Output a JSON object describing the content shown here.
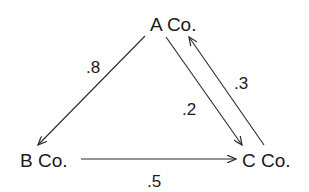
{
  "diagram": {
    "type": "directed-graph",
    "nodes": [
      {
        "id": "A",
        "label": "A Co."
      },
      {
        "id": "B",
        "label": "B Co."
      },
      {
        "id": "C",
        "label": "C Co."
      }
    ],
    "edges": [
      {
        "from": "A",
        "to": "B",
        "label": ".8"
      },
      {
        "from": "A",
        "to": "C",
        "label": ".2"
      },
      {
        "from": "C",
        "to": "A",
        "label": ".3"
      },
      {
        "from": "B",
        "to": "C",
        "label": ".5"
      }
    ],
    "colors": {
      "text": "#1a1a1a",
      "line": "#2a2a2a",
      "background": "#ffffff"
    }
  }
}
